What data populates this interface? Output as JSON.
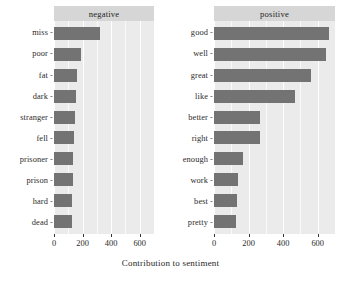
{
  "chart_data": {
    "type": "bar",
    "title": "",
    "xlabel": "Contribution to sentiment",
    "ylabel": "",
    "orientation": "horizontal",
    "grid": true,
    "legend": false,
    "xlim": [
      0,
      700
    ],
    "xticks": [
      0,
      200,
      400,
      600
    ],
    "xtick_labels": [
      "0",
      "200",
      "400",
      "600"
    ],
    "bar_color": "#737373",
    "panel_background": "#ebebeb",
    "strip_background": "#d6d6d6",
    "gridline_color": "#ffffff",
    "facets": [
      {
        "label": "negative",
        "categories": [
          "miss",
          "poor",
          "fat",
          "dark",
          "stranger",
          "fell",
          "prisoner",
          "prison",
          "hard",
          "dead"
        ],
        "values": [
          320,
          187,
          160,
          153,
          147,
          140,
          133,
          133,
          127,
          127
        ]
      },
      {
        "label": "positive",
        "categories": [
          "good",
          "well",
          "great",
          "like",
          "better",
          "right",
          "enough",
          "work",
          "best",
          "pretty"
        ],
        "values": [
          665,
          650,
          560,
          470,
          267,
          267,
          167,
          140,
          133,
          127
        ]
      }
    ]
  }
}
